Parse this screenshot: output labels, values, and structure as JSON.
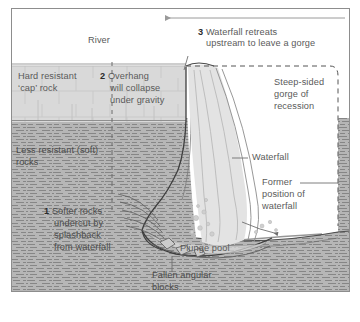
{
  "diagram": {
    "frame": {
      "stroke": "#8d8d8d"
    },
    "colors": {
      "cap_rock": "#d9d9d9",
      "soft_rock": "#b6b6b6",
      "water": "#e3e3e3",
      "text": "#5a5a5a",
      "number": "#2b2b2b",
      "line": "#6f6f6f",
      "dashed": "#555555",
      "background": "#ffffff"
    },
    "labels": {
      "river": "River",
      "step3": {
        "number": "3",
        "text_line1": "Waterfall retreats",
        "text_line2": "upstream to leave a gorge"
      },
      "hard_cap": {
        "line1": "Hard resistant",
        "line2": "‘cap’ rock"
      },
      "step2": {
        "number": "2",
        "text_line1": "Overhang",
        "text_line2": "will collapse",
        "text_line3": "under gravity"
      },
      "gorge": {
        "line1": "Steep-sided",
        "line2": "gorge of",
        "line3": "recession"
      },
      "less_resistant": {
        "line1": "Less resistant (soft)",
        "line2": "rocks"
      },
      "waterfall": "Waterfall",
      "former_position": {
        "line1": "Former",
        "line2": "position of",
        "line3": "waterfall"
      },
      "step1": {
        "number": "1",
        "text_line1": "Softer rocks",
        "text_line2": "undercut by",
        "text_line3": "splashback",
        "text_line4": "from waterfall"
      },
      "plunge_pool": "Plunge pool",
      "fallen_blocks": {
        "line1": "Fallen angular",
        "line2": "blocks"
      }
    },
    "annotations": {
      "retreat_arrow_direction": "left",
      "retreat_arrow_meaning": "direction of waterfall retreat upstream"
    }
  }
}
